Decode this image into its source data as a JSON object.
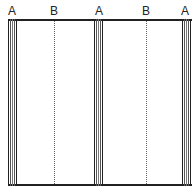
{
  "diagram": {
    "labels": [
      {
        "text": "A",
        "x": 12
      },
      {
        "text": "B",
        "x": 54
      },
      {
        "text": "A",
        "x": 99
      },
      {
        "text": "B",
        "x": 146
      },
      {
        "text": "A",
        "x": 185
      }
    ],
    "a_line_groups": [
      {
        "label": "A",
        "left": 8
      },
      {
        "label": "A",
        "left": 94
      },
      {
        "label": "A",
        "left": 182
      }
    ],
    "b_lines": [
      {
        "label": "B",
        "x": 54
      },
      {
        "label": "B",
        "x": 146
      }
    ],
    "colors": {
      "line": "#222222",
      "thin_line": "#555555",
      "dotted": "#666666"
    }
  }
}
